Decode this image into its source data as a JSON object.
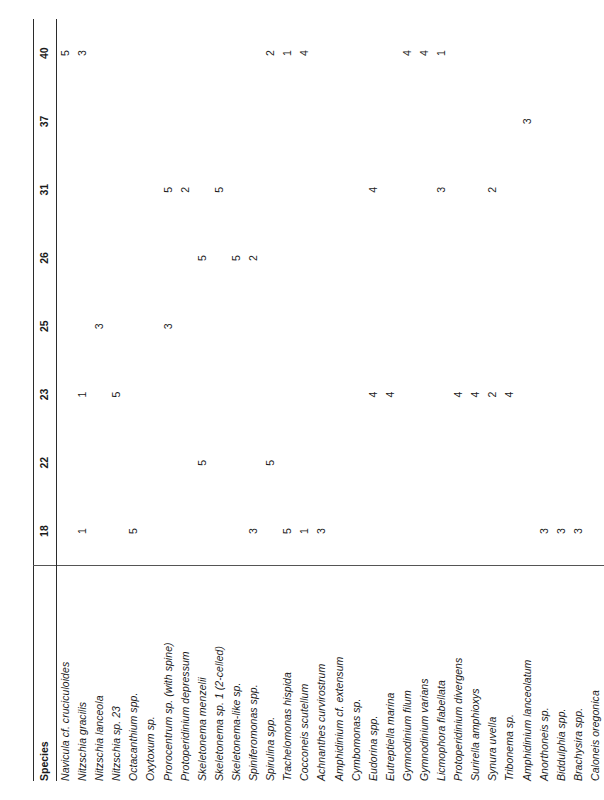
{
  "table": {
    "species_header": "Species",
    "sample_headers": [
      "18",
      "22",
      "23",
      "25",
      "26",
      "31",
      "37",
      "40"
    ],
    "rows": [
      {
        "species": "Navicula cf. cruciculoides",
        "values": [
          "",
          "",
          "",
          "",
          "",
          "",
          "",
          "5"
        ]
      },
      {
        "species": "Nitzschia gracilis",
        "values": [
          "1",
          "",
          "1",
          "",
          "",
          "",
          "",
          "3"
        ]
      },
      {
        "species": "Nitzschia lanceola",
        "values": [
          "",
          "",
          "",
          "3",
          "",
          "",
          "",
          ""
        ]
      },
      {
        "species": "Nitzschia sp. 23",
        "values": [
          "",
          "",
          "5",
          "",
          "",
          "",
          "",
          ""
        ]
      },
      {
        "species": "Octacanthium spp.",
        "values": [
          "5",
          "",
          "",
          "",
          "",
          "",
          "",
          ""
        ]
      },
      {
        "species": "Oxytoxum sp.",
        "values": [
          "",
          "",
          "",
          "",
          "",
          "",
          "",
          ""
        ]
      },
      {
        "species": "Prorocentrum sp. (with spine)",
        "values": [
          "",
          "",
          "",
          "3",
          "",
          "5",
          "",
          ""
        ]
      },
      {
        "species": "Protoperidinium depressum",
        "values": [
          "",
          "",
          "",
          "",
          "",
          "2",
          "",
          ""
        ]
      },
      {
        "species": "Skeletonema menzelii",
        "values": [
          "",
          "5",
          "",
          "",
          "5",
          "",
          "",
          ""
        ]
      },
      {
        "species": "Skeletonema sp. 1 (2-celled)",
        "values": [
          "",
          "",
          "",
          "",
          "",
          "5",
          "",
          ""
        ]
      },
      {
        "species": "Skeletonema-like sp.",
        "values": [
          "",
          "",
          "",
          "",
          "5",
          "",
          "",
          ""
        ]
      },
      {
        "species": "Spiniferomonas spp.",
        "values": [
          "3",
          "",
          "",
          "",
          "2",
          "",
          "",
          ""
        ]
      },
      {
        "species": "Spirulina spp.",
        "values": [
          "",
          "5",
          "",
          "",
          "",
          "",
          "",
          "2"
        ]
      },
      {
        "species": "Trachelomonas hispida",
        "values": [
          "5",
          "",
          "",
          "",
          "",
          "",
          "",
          "1"
        ]
      },
      {
        "species": "Cocconeis scutellum",
        "values": [
          "1",
          "",
          "",
          "",
          "",
          "",
          "",
          "4"
        ]
      },
      {
        "species": "Achnanthes curvirostrum",
        "values": [
          "3",
          "",
          "",
          "",
          "",
          "",
          "",
          ""
        ]
      },
      {
        "species": "Amphidinium cf. extensum",
        "values": [
          "",
          "",
          "",
          "",
          "",
          "",
          "",
          ""
        ]
      },
      {
        "species": "Cymbomonas sp.",
        "values": [
          "",
          "",
          "",
          "",
          "",
          "",
          "",
          ""
        ]
      },
      {
        "species": "Eudorina spp.",
        "values": [
          "",
          "",
          "4",
          "",
          "",
          "4",
          "",
          ""
        ]
      },
      {
        "species": "Eutreptiella marina",
        "values": [
          "",
          "",
          "4",
          "",
          "",
          "",
          "",
          ""
        ]
      },
      {
        "species": "Gymnodinium filum",
        "values": [
          "",
          "",
          "",
          "",
          "",
          "",
          "",
          "4"
        ]
      },
      {
        "species": "Gymnodinium varians",
        "values": [
          "",
          "",
          "",
          "",
          "",
          "",
          "",
          "4"
        ]
      },
      {
        "species": "Licmophora flabellata",
        "values": [
          "",
          "",
          "",
          "",
          "",
          "3",
          "",
          "1"
        ]
      },
      {
        "species": "Protoperidinium divergens",
        "values": [
          "",
          "",
          "4",
          "",
          "",
          "",
          "",
          ""
        ]
      },
      {
        "species": "Surirella amphioxys",
        "values": [
          "",
          "",
          "4",
          "",
          "",
          "",
          "",
          ""
        ]
      },
      {
        "species": "Synura uvella",
        "values": [
          "",
          "",
          "2",
          "",
          "",
          "2",
          "",
          ""
        ]
      },
      {
        "species": "Tribonema sp.",
        "values": [
          "",
          "",
          "4",
          "",
          "",
          "",
          "",
          ""
        ]
      },
      {
        "species": "Amphidinium lanceolatum",
        "values": [
          "",
          "",
          "",
          "",
          "",
          "",
          "3",
          ""
        ]
      },
      {
        "species": "Anorthoneis sp.",
        "values": [
          "3",
          "",
          "",
          "",
          "",
          "",
          "",
          ""
        ]
      },
      {
        "species": "Biddulphia spp.",
        "values": [
          "3",
          "",
          "",
          "",
          "",
          "",
          "",
          ""
        ]
      },
      {
        "species": "Brachysira spp.",
        "values": [
          "3",
          "",
          "",
          "",
          "",
          "",
          "",
          ""
        ]
      },
      {
        "species": "Caloneis oregonica",
        "values": [
          "",
          "",
          "",
          "",
          "",
          "",
          "",
          ""
        ]
      }
    ]
  }
}
